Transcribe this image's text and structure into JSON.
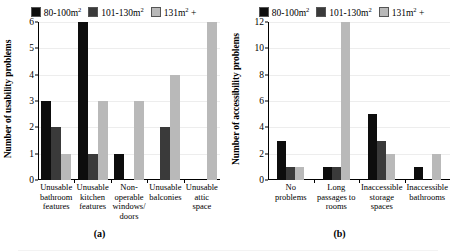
{
  "legend": {
    "items": [
      {
        "label": "80-100m",
        "sup": "2",
        "suffix": "",
        "color": "#0d0d0d",
        "name": "series-80-100"
      },
      {
        "label": "101-130m",
        "sup": "2",
        "suffix": "",
        "color": "#3a3a3a",
        "name": "series-101-130"
      },
      {
        "label": "131m",
        "sup": "2",
        "suffix": " +",
        "color": "#b9b9b9",
        "name": "series-131-plus"
      }
    ]
  },
  "colors": {
    "s1": "#0d0d0d",
    "s2": "#3a3a3a",
    "s3": "#b9b9b9",
    "grid": "#ededed",
    "axis": "#000000"
  },
  "panel_a": {
    "caption": "(a)",
    "ylabel": "Number of usability problems",
    "yticks": [
      "0",
      "1",
      "2",
      "3",
      "4",
      "5",
      "6"
    ],
    "categories": [
      "Unusable bathroom features",
      "Unusable kitchen features",
      "Non-operable windows/ doors",
      "Unusable balconies",
      "Unusable attic space"
    ]
  },
  "panel_b": {
    "caption": "(b)",
    "ylabel": "Number of accessibility problems",
    "yticks": [
      "0",
      "2",
      "4",
      "6",
      "8",
      "10",
      "12"
    ],
    "categories": [
      "No problems",
      "Long passages to rooms",
      "Inaccessible storage spaces",
      "Inaccessible bathrooms"
    ]
  },
  "chart_data": [
    {
      "type": "bar",
      "panel": "(a)",
      "title": "",
      "xlabel": "",
      "ylabel": "Number of usability problems",
      "ylim": [
        0,
        6
      ],
      "ytick_step": 1,
      "grid": true,
      "legend_position": "top-center",
      "categories": [
        "Unusable bathroom features",
        "Unusable kitchen features",
        "Non-operable windows/ doors",
        "Unusable balconies",
        "Unusable attic space"
      ],
      "series": [
        {
          "name": "80-100m2",
          "color": "#0d0d0d",
          "values": [
            3,
            6,
            1,
            0,
            0
          ]
        },
        {
          "name": "101-130m2",
          "color": "#3a3a3a",
          "values": [
            2,
            1,
            0,
            2,
            0
          ]
        },
        {
          "name": "131m2 +",
          "color": "#b9b9b9",
          "values": [
            1,
            3,
            3,
            4,
            6
          ]
        }
      ]
    },
    {
      "type": "bar",
      "panel": "(b)",
      "title": "",
      "xlabel": "",
      "ylabel": "Number of accessibility problems",
      "ylim": [
        0,
        12
      ],
      "ytick_step": 2,
      "grid": true,
      "legend_position": "top-center",
      "categories": [
        "No problems",
        "Long passages to rooms",
        "Inaccessible storage spaces",
        "Inaccessible bathrooms"
      ],
      "series": [
        {
          "name": "80-100m2",
          "color": "#0d0d0d",
          "values": [
            3,
            1,
            5,
            1
          ]
        },
        {
          "name": "101-130m2",
          "color": "#3a3a3a",
          "values": [
            1,
            1,
            3,
            0
          ]
        },
        {
          "name": "131m2 +",
          "color": "#b9b9b9",
          "values": [
            1,
            12,
            2,
            2
          ]
        }
      ]
    }
  ]
}
